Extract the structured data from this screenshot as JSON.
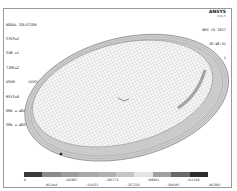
{
  "info": {
    "title": "NODAL SOLUTION",
    "lines": [
      "STEP=2",
      "SUB =1",
      "TIME=2",
      "USUM      (AVG)",
      "RSYS=0",
      "DMX =.462992",
      "SMX =.462992"
    ]
  },
  "brand": {
    "logo": "ANSYS",
    "version": "R14.5"
  },
  "meta": {
    "date": "NOV 15 2017",
    "time": "16:48:51",
    "plot_no": "PLOT NO.   1"
  },
  "legend": {
    "colors": [
      "#3a3a3a",
      "#8a8a8a",
      "#9c9c9c",
      "#a8a8a8",
      "#b0b0b0",
      "#c6c6c6",
      "#e4e4e4",
      "#a0a0a0",
      "#6a6a6a",
      "#2e2e2e"
    ],
    "values_top": [
      "0",
      ".102887",
      ".205774",
      ".308661",
      ".411548"
    ],
    "values_bottom": [
      ".051444",
      ".154331",
      ".257218",
      ".360105",
      ".462992"
    ]
  }
}
